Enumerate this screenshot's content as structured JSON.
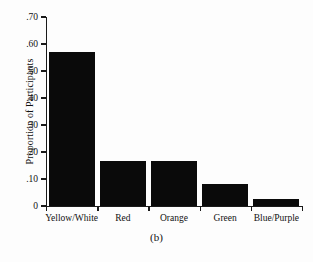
{
  "chart_data": {
    "type": "bar",
    "title": "",
    "subtitle": "",
    "caption": "(b)",
    "xlabel": "",
    "ylabel": "Proportion of Participants",
    "categories": [
      "Yellow/White",
      "Red",
      "Orange",
      "Green",
      "Blue/Purple"
    ],
    "values": [
      0.57,
      0.167,
      0.165,
      0.081,
      0.026
    ],
    "ylim": [
      0,
      0.7
    ],
    "yticks": [
      0,
      0.1,
      0.2,
      0.3,
      0.4,
      0.5,
      0.6,
      0.7
    ],
    "ytick_labels": [
      "0",
      ".10",
      ".20",
      ".30",
      ".40",
      ".50",
      ".60",
      ".70"
    ],
    "grid": false,
    "legend": null,
    "bar_color": "#0a0a0a",
    "axis_color": "#1a1a1a",
    "background_color": "#fdfdfd"
  }
}
